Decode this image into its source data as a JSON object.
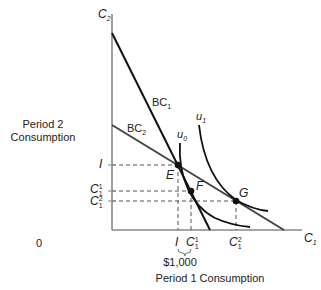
{
  "diagram": {
    "y_axis_title_line1": "Period 2",
    "y_axis_title_line2": "Consumption",
    "x_axis_title": "Period 1 Consumption",
    "y_axis_label": "C",
    "y_axis_sub": "2",
    "x_axis_label": "C",
    "x_axis_sub": "1",
    "origin_label": "0",
    "budget_lines": [
      {
        "name": "BC",
        "sub": "1"
      },
      {
        "name": "BC",
        "sub": "2"
      }
    ],
    "indifference_curves": [
      {
        "name": "u",
        "sub": "0"
      },
      {
        "name": "u",
        "sub": "1"
      }
    ],
    "points": [
      {
        "label": "E"
      },
      {
        "label": "F"
      },
      {
        "label": "G"
      }
    ],
    "y_ticks": [
      {
        "main": "I",
        "sup": ""
      },
      {
        "main": "C",
        "sup": "1",
        "sub": "1"
      },
      {
        "main": "C",
        "sup": "2",
        "sub": "1"
      }
    ],
    "x_ticks": [
      {
        "main": "I",
        "sup": ""
      },
      {
        "main": "C",
        "sup": "1",
        "sub": "1"
      },
      {
        "main": "C",
        "sup": "2",
        "sub": "1"
      }
    ],
    "brace_label": "$1,000",
    "colors": {
      "axis": "#888888",
      "bc1": "#111111",
      "bc2": "#444444",
      "curve": "#111111",
      "dash": "#555555"
    }
  }
}
